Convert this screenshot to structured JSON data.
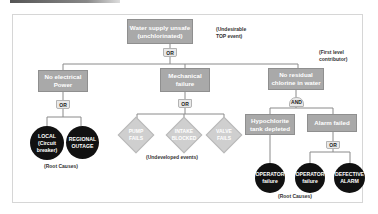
{
  "diagram": {
    "type": "fault-tree",
    "top_event": {
      "label": "Water supply unsafe\n(unchlorinated)",
      "gate": "OR",
      "annotation": "(Undesirable\nTOP event)"
    },
    "first_level_annotation": "(First level\ncontributor)",
    "branches": [
      {
        "label": "No electrical\nPower",
        "gate": "OR",
        "children": [
          {
            "label": "LOCAL\n(Circuit\nbreaker)",
            "shape": "circle"
          },
          {
            "label": "REGIONAL\nOUTAGE",
            "shape": "circle"
          }
        ],
        "annotation": "(Root Causes)"
      },
      {
        "label": "Mechanical\nfailure",
        "gate": "OR",
        "children": [
          {
            "label": "PUMP\nFAILS",
            "shape": "diamond"
          },
          {
            "label": "INTAKE\nBLOCKED",
            "shape": "diamond"
          },
          {
            "label": "VALVE\nFAILS",
            "shape": "diamond"
          }
        ],
        "annotation": "(Undeveloped events)"
      },
      {
        "label": "No residual\nchlorine in water",
        "gate": "AND",
        "children": [
          {
            "label": "Hypochlorite\ntank depleted",
            "children": [
              {
                "label": "OPERATOR\nfailure",
                "shape": "circle"
              }
            ]
          },
          {
            "label": "Alarm failed",
            "gate": "OR",
            "children": [
              {
                "label": "OPERATOR\nfailure",
                "shape": "circle"
              },
              {
                "label": "DEFECTIVE\nALARM",
                "shape": "circle"
              }
            ]
          }
        ],
        "annotation": "(Root Causes)"
      }
    ]
  }
}
